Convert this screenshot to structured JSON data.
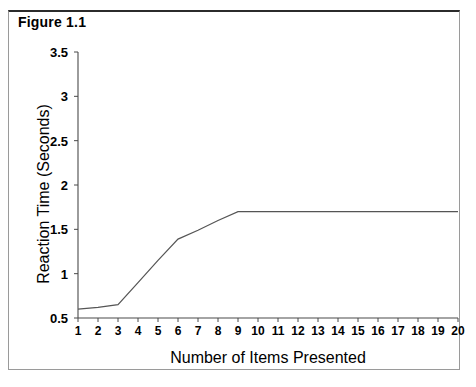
{
  "figure": {
    "title": "Figure 1.1"
  },
  "chart_data": {
    "type": "line",
    "title": "Figure 1.1",
    "xlabel": "Number of Items Presented",
    "ylabel": "Reaction Time (Seconds)",
    "xlim": [
      1,
      20
    ],
    "ylim": [
      0.5,
      3.5
    ],
    "grid": false,
    "legend": null,
    "x_ticks": [
      1,
      2,
      3,
      4,
      5,
      6,
      7,
      8,
      9,
      10,
      11,
      12,
      13,
      14,
      15,
      16,
      17,
      18,
      19,
      20
    ],
    "x_tick_labels": [
      "1",
      "2",
      "3",
      "4",
      "5",
      "6",
      "7",
      "8",
      "9",
      "10",
      "11",
      "12",
      "13",
      "14",
      "15",
      "16",
      "17",
      "18",
      "19",
      "20"
    ],
    "y_ticks": [
      0.5,
      1,
      1.5,
      2,
      2.5,
      3,
      3.5
    ],
    "y_tick_labels": [
      "0.5",
      "1",
      "1.5",
      "2",
      "2.5",
      "3",
      "3.5"
    ],
    "series": [
      {
        "name": "Reaction Time",
        "color": "#555555",
        "x": [
          1,
          2,
          3,
          4,
          5,
          6,
          7,
          8,
          9,
          10,
          11,
          12,
          13,
          14,
          15,
          16,
          17,
          18,
          19,
          20
        ],
        "values": [
          0.6,
          0.62,
          0.65,
          0.9,
          1.15,
          1.39,
          1.49,
          1.6,
          1.7,
          1.7,
          1.7,
          1.7,
          1.7,
          1.7,
          1.7,
          1.7,
          1.7,
          1.7,
          1.7,
          1.7
        ]
      }
    ]
  }
}
